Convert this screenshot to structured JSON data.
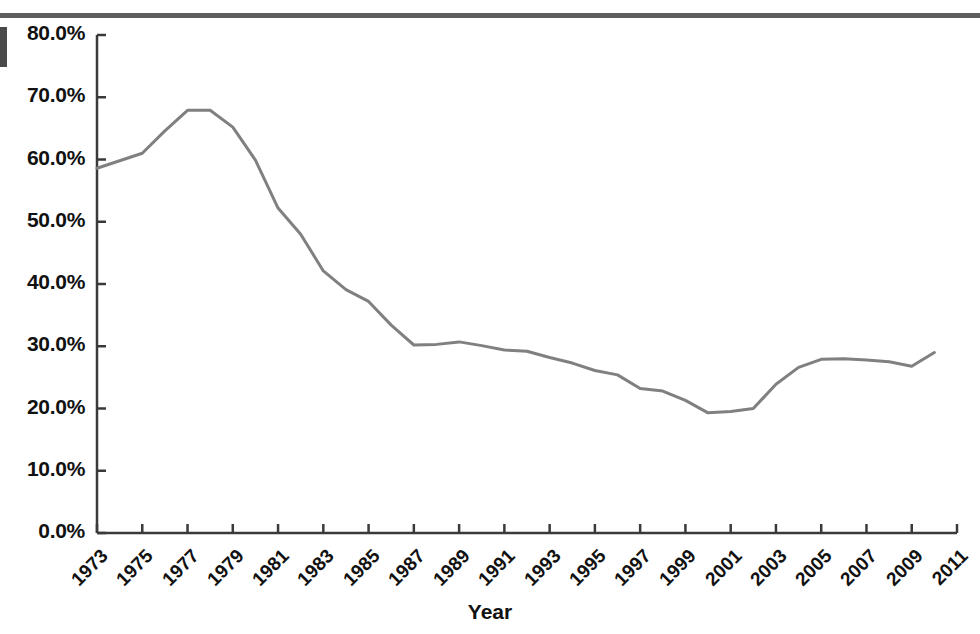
{
  "figure": {
    "top_rule_color": "#5e5e5e",
    "left_marker_color": "#4a4a4a",
    "background_color": "#ffffff"
  },
  "chart_data": {
    "type": "line",
    "title": "",
    "subtitle": "",
    "xlabel": "Year",
    "ylabel": "",
    "grid": false,
    "legend": false,
    "legend_position": "none",
    "line_color": "#808080",
    "line_width": 3,
    "axis_color": "#3a3a3a",
    "xlim": [
      1973,
      2011
    ],
    "ylim": [
      0,
      80
    ],
    "x_tick_labels": [
      "1973",
      "1975",
      "1977",
      "1979",
      "1981",
      "1983",
      "1985",
      "1987",
      "1989",
      "1991",
      "1993",
      "1995",
      "1997",
      "1999",
      "2001",
      "2003",
      "2005",
      "2007",
      "2009",
      "2011"
    ],
    "x_tick_values": [
      1973,
      1975,
      1977,
      1979,
      1981,
      1983,
      1985,
      1987,
      1989,
      1991,
      1993,
      1995,
      1997,
      1999,
      2001,
      2003,
      2005,
      2007,
      2009,
      2011
    ],
    "y_tick_labels": [
      "0.0%",
      "10.0%",
      "20.0%",
      "30.0%",
      "40.0%",
      "50.0%",
      "60.0%",
      "70.0%",
      "80.0%"
    ],
    "y_tick_values": [
      0,
      10,
      20,
      30,
      40,
      50,
      60,
      70,
      80
    ],
    "x": [
      1973,
      1974,
      1975,
      1976,
      1977,
      1978,
      1979,
      1980,
      1981,
      1982,
      1983,
      1984,
      1985,
      1986,
      1987,
      1988,
      1989,
      1990,
      1991,
      1992,
      1993,
      1994,
      1995,
      1996,
      1997,
      1998,
      1999,
      2000,
      2001,
      2002,
      2003,
      2004,
      2005,
      2006,
      2007,
      2008,
      2009,
      2010
    ],
    "values": [
      58.6,
      59.8,
      61.0,
      64.6,
      67.9,
      67.9,
      65.2,
      59.9,
      52.2,
      48.0,
      42.1,
      39.1,
      37.2,
      33.4,
      30.2,
      30.3,
      30.7,
      30.1,
      29.4,
      29.2,
      28.2,
      27.3,
      26.1,
      25.4,
      23.2,
      22.8,
      21.3,
      19.3,
      19.5,
      20.0,
      23.9,
      26.6,
      27.9,
      28.0,
      27.8,
      27.5,
      26.8,
      29.0
    ]
  }
}
